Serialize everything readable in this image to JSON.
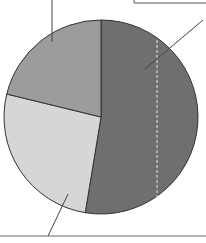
{
  "chart_data": {
    "type": "pie",
    "title": "",
    "slices": [
      {
        "label": "",
        "value": 52.6,
        "color": "#6f6f6f"
      },
      {
        "label": "",
        "value": 26.2,
        "color": "#d6d6d6"
      },
      {
        "label": "",
        "value": 21.2,
        "color": "#9c9c9c"
      }
    ],
    "start_angle_deg": 0,
    "direction": "clockwise",
    "legend": "none",
    "labels_visible": false,
    "leader_lines": true
  }
}
